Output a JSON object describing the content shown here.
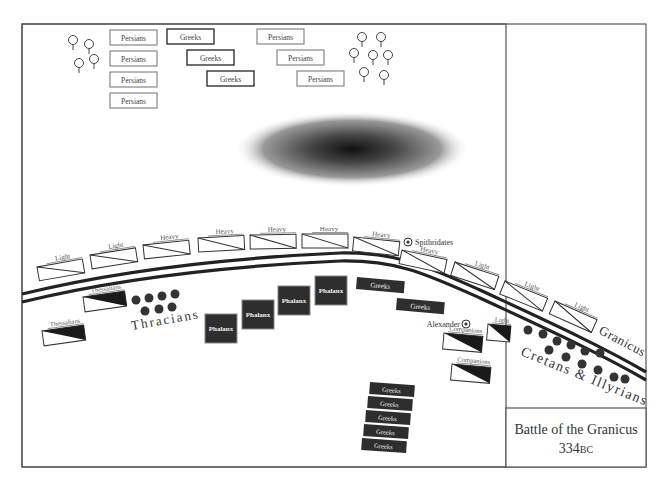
{
  "title_box": {
    "title": "Battle of the Granicus",
    "year": "334",
    "era": "BC"
  },
  "river": {
    "label": "Granicus"
  },
  "colors": {
    "frame": "#555555",
    "ink": "#222222",
    "dark_unit": "#333333",
    "light_box_border": "#999999",
    "dot": "#333333"
  },
  "persian_reserve": [
    {
      "label": "Persians",
      "x": 110,
      "y": 30
    },
    {
      "label": "Persians",
      "x": 110,
      "y": 51
    },
    {
      "label": "Persians",
      "x": 110,
      "y": 72
    },
    {
      "label": "Persians",
      "x": 110,
      "y": 93
    },
    {
      "label": "Persians",
      "x": 257,
      "y": 29
    },
    {
      "label": "Persians",
      "x": 277,
      "y": 50
    },
    {
      "label": "Persians",
      "x": 297,
      "y": 71
    }
  ],
  "greek_mercenaries": [
    {
      "label": "Greeks",
      "x": 167,
      "y": 29
    },
    {
      "label": "Greeks",
      "x": 187,
      "y": 50
    },
    {
      "label": "Greeks",
      "x": 207,
      "y": 71
    }
  ],
  "persian_cavalry_line": [
    {
      "label": "Light",
      "x": 37,
      "y": 267,
      "rot": -10
    },
    {
      "label": "Light",
      "x": 90,
      "y": 255,
      "rot": -9
    },
    {
      "label": "Heavy",
      "x": 143,
      "y": 245,
      "rot": -6
    },
    {
      "label": "Heavy",
      "x": 198,
      "y": 238,
      "rot": -3
    },
    {
      "label": "Heavy",
      "x": 250,
      "y": 235,
      "rot": -1
    },
    {
      "label": "Heavy",
      "x": 302,
      "y": 234,
      "rot": 0
    },
    {
      "label": "Heavy",
      "x": 354,
      "y": 237,
      "rot": 6
    },
    {
      "label": "Heavy",
      "x": 402,
      "y": 250,
      "rot": 12
    },
    {
      "label": "Light",
      "x": 455,
      "y": 262,
      "rot": 18
    },
    {
      "label": "Light",
      "x": 505,
      "y": 281,
      "rot": 22
    },
    {
      "label": "Light",
      "x": 555,
      "y": 301,
      "rot": 24
    }
  ],
  "commanders": [
    {
      "label": "Spithridates",
      "x": 408,
      "y": 242
    },
    {
      "label": "Alexander",
      "x": 466,
      "y": 324
    }
  ],
  "macedonian_left": [
    {
      "label": "Thessalians",
      "x": 83,
      "y": 297,
      "rot": -8
    },
    {
      "label": "Thessalians",
      "x": 42,
      "y": 331,
      "rot": -8
    }
  ],
  "thracians": {
    "label": "Thracians"
  },
  "phalanx": [
    {
      "label": "Phalanx",
      "x": 205,
      "y": 314
    },
    {
      "label": "Phalanx",
      "x": 242,
      "y": 300
    },
    {
      "label": "Phalanx",
      "x": 278,
      "y": 286
    },
    {
      "label": "Phalanx",
      "x": 315,
      "y": 276
    }
  ],
  "greek_allies_front": [
    {
      "label": "Greeks",
      "x": 357,
      "y": 277,
      "rot": 5
    },
    {
      "label": "Greeks",
      "x": 397,
      "y": 298,
      "rot": 5
    }
  ],
  "macedonian_right": [
    {
      "label": "Companions",
      "x": 444,
      "y": 333,
      "rot": 5
    },
    {
      "label": "Light",
      "x": 488,
      "y": 324,
      "rot": 5
    },
    {
      "label": "Companions",
      "x": 452,
      "y": 364,
      "rot": 5
    }
  ],
  "cretans_illyrians": {
    "label": "Cretans & Illyrians"
  },
  "greek_reserve": [
    {
      "label": "Greeks",
      "x": 370,
      "y": 382
    },
    {
      "label": "Greeks",
      "x": 368,
      "y": 396
    },
    {
      "label": "Greeks",
      "x": 366,
      "y": 410
    },
    {
      "label": "Greeks",
      "x": 364,
      "y": 424
    },
    {
      "label": "Greeks",
      "x": 362,
      "y": 438
    }
  ]
}
